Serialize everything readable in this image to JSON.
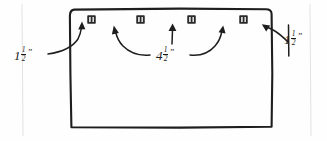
{
  "diagram": {
    "style": "hand-drawn pencil sketch on white paper",
    "board": {
      "name": "rectangle-board",
      "x": 70,
      "y": 9,
      "width": 202,
      "height": 119
    },
    "brackets": [
      {
        "id": "bracket-1",
        "label": "bracket",
        "x": 91,
        "y": 19
      },
      {
        "id": "bracket-2",
        "label": "bracket",
        "x": 140,
        "y": 19
      },
      {
        "id": "bracket-3",
        "label": "bracket",
        "x": 191,
        "y": 19
      },
      {
        "id": "bracket-4",
        "label": "bracket",
        "x": 243,
        "y": 19
      }
    ],
    "measurements": [
      {
        "id": "measure-left",
        "whole": "1",
        "numerator": "1",
        "denominator": "2",
        "unit": "”",
        "text": "1½”",
        "describes": "distance from left edge to first bracket"
      },
      {
        "id": "measure-middle",
        "whole": "4",
        "numerator": "1",
        "denominator": "2",
        "unit": "”",
        "text": "4½”",
        "describes": "spacing between adjacent brackets"
      },
      {
        "id": "measure-right",
        "whole": "1",
        "numerator": "1",
        "denominator": "2",
        "unit": "”",
        "text": "1½”",
        "describes": "distance from right edge to last bracket"
      }
    ],
    "colors": {
      "ink": "#1e1e1e",
      "paper": "#fefefe",
      "bracket": "#2b2b2b",
      "scan_artifact": "#e3e3e3"
    }
  }
}
